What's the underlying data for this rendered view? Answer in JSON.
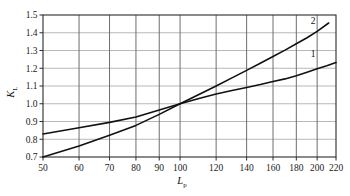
{
  "chart_data": {
    "type": "line",
    "title": "",
    "xlabel": "L",
    "xlabel_sub": "p",
    "ylabel": "K",
    "ylabel_sub": "L",
    "xscale": "log",
    "yscale": "linear",
    "xlim": [
      50,
      220
    ],
    "ylim": [
      0.7,
      1.5
    ],
    "grid": true,
    "legend_position": "inline-right",
    "xticks": [
      50,
      60,
      70,
      80,
      90,
      100,
      120,
      140,
      160,
      180,
      200,
      220
    ],
    "xticklabels": [
      "50",
      "60",
      "70",
      "80",
      "90",
      "100",
      "120",
      "140",
      "160",
      "180",
      "200",
      "220"
    ],
    "yticks": [
      0.7,
      0.8,
      0.9,
      1.0,
      1.1,
      1.2,
      1.3,
      1.4,
      1.5
    ],
    "yticklabels": [
      "0.7",
      "0.8",
      "0.9",
      "1.0",
      "1.1",
      "1.2",
      "1.3",
      "1.4",
      "1.5"
    ],
    "series": [
      {
        "name": "1",
        "label": "1",
        "color": "#111111",
        "x": [
          50,
          60,
          70,
          80,
          90,
          100,
          110,
          120,
          130,
          140,
          150,
          160,
          170,
          180,
          190,
          200,
          210,
          220
        ],
        "y": [
          0.83,
          0.865,
          0.895,
          0.925,
          0.965,
          1.0,
          1.03,
          1.055,
          1.075,
          1.092,
          1.108,
          1.125,
          1.14,
          1.158,
          1.178,
          1.197,
          1.214,
          1.232
        ]
      },
      {
        "name": "2",
        "label": "2",
        "color": "#111111",
        "x": [
          50,
          60,
          70,
          80,
          90,
          100,
          110,
          120,
          130,
          140,
          150,
          160,
          170,
          180,
          190,
          200,
          212
        ],
        "y": [
          0.7,
          0.762,
          0.822,
          0.878,
          0.94,
          1.0,
          1.052,
          1.1,
          1.146,
          1.188,
          1.228,
          1.266,
          1.302,
          1.338,
          1.372,
          1.408,
          1.455
        ]
      }
    ],
    "annotations": [
      {
        "text": "2",
        "x": 196,
        "y": 1.452
      },
      {
        "text": "1",
        "x": 196,
        "y": 1.262
      }
    ],
    "colors": {
      "axis": "#2b2b2b",
      "grid_vertical": "#6e6e6e",
      "grid_horizontal": "#b8b8b8",
      "curve": "#111111",
      "background": "#ffffff"
    }
  }
}
